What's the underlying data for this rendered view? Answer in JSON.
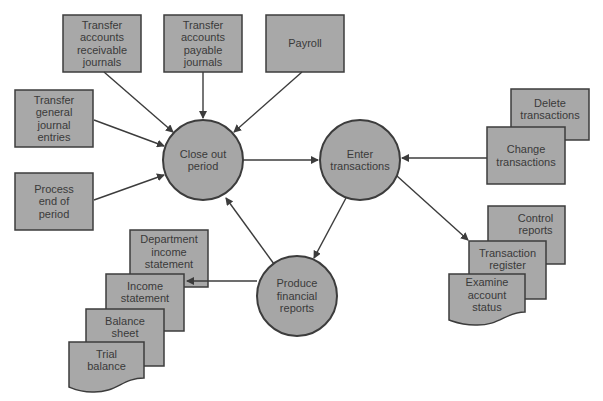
{
  "diagram": {
    "colors": {
      "box_fill": "#a8a8a8",
      "box_stroke": "#3c3c3c",
      "circle_fill": "#a6a6a6",
      "text": "#3a3a3a",
      "background": "#ffffff"
    },
    "processes": {
      "close_out": "Close out\nperiod",
      "enter": "Enter\ntransactions",
      "produce": "Produce\nfinancial\nreports"
    },
    "inputs": {
      "ar": "Transfer\naccounts\nreceivable\njournals",
      "ap": "Transfer\naccounts\npayable\njournals",
      "payroll": "Payroll",
      "gj": "Transfer\ngeneral\njournal\nentries",
      "eop": "Process\nend of\nperiod"
    },
    "transactions": {
      "delete": "Delete\ntransactions",
      "change": "Change\ntransactions"
    },
    "tx_reports": {
      "control": "Control\nreports",
      "register": "Transaction\nregister",
      "examine": "Examine\naccount\nstatus"
    },
    "fin_reports": {
      "dept": "Department\nincome\nstatement",
      "income": "Income\nstatement",
      "balance": "Balance\nsheet",
      "trial": "Trial\nbalance"
    }
  }
}
